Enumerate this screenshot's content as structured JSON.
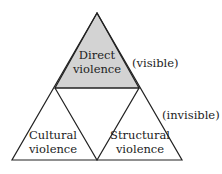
{
  "diagram": {
    "top": {
      "line1": "Direct",
      "line2": "violence",
      "fill": "#d3d3d3"
    },
    "bottom_left": {
      "line1": "Cultural",
      "line2": "violence"
    },
    "bottom_right": {
      "line1": "Structural",
      "line2": "violence"
    },
    "annotation_visible": "(visible)",
    "annotation_invisible": "(invisible)"
  }
}
